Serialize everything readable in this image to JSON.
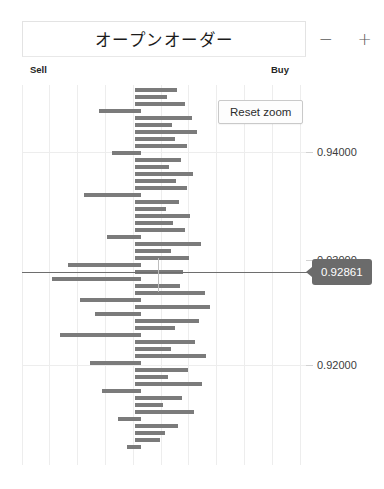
{
  "header": {
    "title": "オープンオーダー",
    "zoom_out_label": "−",
    "zoom_out_icon": "minus-icon",
    "zoom_in_label": "+",
    "zoom_in_icon": "plus-icon"
  },
  "axis_labels": {
    "left": "Sell",
    "right": "Buy"
  },
  "controls": {
    "reset_zoom_label": "Reset zoom"
  },
  "crosshair": {
    "tooltip_value": "0.92861"
  },
  "colors": {
    "bar": "#7b7b7b",
    "grid": "#ededed",
    "tooltip_bg": "#6b6b6b",
    "crosshair": "#6e6e6e",
    "text": "#1b1b1b"
  },
  "chart_data": {
    "type": "bar",
    "orientation": "horizontal",
    "title": "オープンオーダー",
    "xlabel": "",
    "ylabel": "",
    "grid": true,
    "legend_position": "top-inside",
    "legend": [
      "Sell",
      "Buy"
    ],
    "ylim": [
      0.914,
      0.95
    ],
    "yticks": [
      0.94,
      0.93,
      0.92
    ],
    "ytick_labels": [
      "0.94000",
      "0.93000",
      "0.92000"
    ],
    "xlim": [
      -5,
      5
    ],
    "center_price": 0.92861,
    "annotation": "0.92861",
    "note": "Each row is one open order; bar length = order size, direction = Sell (left) / Buy (right). Values below are [price, signed_size] where negative = Sell side.",
    "rows": [
      [
        0.9493,
        1.05
      ],
      [
        0.9485,
        0.6
      ],
      [
        0.94775,
        1.35
      ],
      [
        0.947,
        -1.5
      ],
      [
        0.9462,
        1.6
      ],
      [
        0.94545,
        0.8
      ],
      [
        0.9447,
        1.95
      ],
      [
        0.9439,
        0.95
      ],
      [
        0.94315,
        1.5
      ],
      [
        0.9424,
        -1.1
      ],
      [
        0.9416,
        1.25
      ],
      [
        0.94085,
        0.75
      ],
      [
        0.9401,
        1.8
      ],
      [
        0.9393,
        1.0
      ],
      [
        0.93855,
        1.45
      ],
      [
        0.9378,
        -2.05
      ],
      [
        0.937,
        1.15
      ],
      [
        0.93625,
        0.7
      ],
      [
        0.9355,
        1.7
      ],
      [
        0.9347,
        0.9
      ],
      [
        0.93395,
        1.4
      ],
      [
        0.9332,
        -1.25
      ],
      [
        0.9324,
        2.1
      ],
      [
        0.93165,
        0.85
      ],
      [
        0.9309,
        1.55
      ],
      [
        0.9301,
        -2.4
      ],
      [
        0.92935,
        1.3
      ],
      [
        0.9286,
        -3.6
      ],
      [
        0.92785,
        1.2
      ],
      [
        0.92705,
        2.25
      ],
      [
        0.9263,
        -1.95
      ],
      [
        0.92555,
        2.45
      ],
      [
        0.92475,
        -1.4
      ],
      [
        0.924,
        2.0
      ],
      [
        0.92325,
        1.1
      ],
      [
        0.92245,
        -2.6
      ],
      [
        0.9217,
        1.9
      ],
      [
        0.92095,
        0.95
      ],
      [
        0.92015,
        2.3
      ],
      [
        0.9194,
        -1.55
      ],
      [
        0.91865,
        1.65
      ],
      [
        0.91785,
        0.8
      ],
      [
        0.9171,
        2.15
      ],
      [
        0.91635,
        -1.2
      ],
      [
        0.91555,
        1.45
      ],
      [
        0.9148,
        0.65
      ],
      [
        0.91405,
        1.85
      ]
    ]
  },
  "bars": [
    {
      "t": 3,
      "l": 113,
      "w": 42
    },
    {
      "t": 10,
      "l": 113,
      "w": 32
    },
    {
      "t": 17,
      "l": 113,
      "w": 50
    },
    {
      "t": 24,
      "l": 77,
      "w": 42
    },
    {
      "t": 31,
      "l": 113,
      "w": 57
    },
    {
      "t": 38,
      "l": 113,
      "w": 37
    },
    {
      "t": 45,
      "l": 113,
      "w": 62
    },
    {
      "t": 52,
      "l": 113,
      "w": 40
    },
    {
      "t": 59,
      "l": 113,
      "w": 52
    },
    {
      "t": 66,
      "l": 90,
      "w": 29
    },
    {
      "t": 73,
      "l": 113,
      "w": 46
    },
    {
      "t": 80,
      "l": 113,
      "w": 34
    },
    {
      "t": 87,
      "l": 113,
      "w": 58
    },
    {
      "t": 94,
      "l": 113,
      "w": 41
    },
    {
      "t": 101,
      "l": 113,
      "w": 52
    },
    {
      "t": 108,
      "l": 62,
      "w": 57
    },
    {
      "t": 115,
      "l": 113,
      "w": 44
    },
    {
      "t": 122,
      "l": 113,
      "w": 31
    },
    {
      "t": 129,
      "l": 113,
      "w": 55
    },
    {
      "t": 136,
      "l": 113,
      "w": 38
    },
    {
      "t": 143,
      "l": 113,
      "w": 50
    },
    {
      "t": 150,
      "l": 85,
      "w": 34
    },
    {
      "t": 157,
      "l": 113,
      "w": 66
    },
    {
      "t": 164,
      "l": 113,
      "w": 36
    },
    {
      "t": 171,
      "l": 113,
      "w": 54
    },
    {
      "t": 178,
      "l": 46,
      "w": 73
    },
    {
      "t": 185,
      "l": 113,
      "w": 48
    },
    {
      "t": 192,
      "l": 30,
      "w": 89
    },
    {
      "t": 199,
      "l": 113,
      "w": 45
    },
    {
      "t": 206,
      "l": 113,
      "w": 70
    },
    {
      "t": 213,
      "l": 58,
      "w": 61
    },
    {
      "t": 220,
      "l": 113,
      "w": 75
    },
    {
      "t": 227,
      "l": 73,
      "w": 46
    },
    {
      "t": 234,
      "l": 113,
      "w": 64
    },
    {
      "t": 241,
      "l": 113,
      "w": 40
    },
    {
      "t": 248,
      "l": 38,
      "w": 81
    },
    {
      "t": 255,
      "l": 113,
      "w": 60
    },
    {
      "t": 262,
      "l": 113,
      "w": 36
    },
    {
      "t": 269,
      "l": 113,
      "w": 71
    },
    {
      "t": 276,
      "l": 68,
      "w": 51
    },
    {
      "t": 283,
      "l": 113,
      "w": 53
    },
    {
      "t": 290,
      "l": 113,
      "w": 33
    },
    {
      "t": 297,
      "l": 113,
      "w": 67
    },
    {
      "t": 304,
      "l": 80,
      "w": 39
    },
    {
      "t": 311,
      "l": 113,
      "w": 47
    },
    {
      "t": 318,
      "l": 113,
      "w": 28
    },
    {
      "t": 325,
      "l": 113,
      "w": 59
    },
    {
      "t": 332,
      "l": 96,
      "w": 23
    },
    {
      "t": 339,
      "l": 113,
      "w": 43
    },
    {
      "t": 346,
      "l": 113,
      "w": 30
    },
    {
      "t": 353,
      "l": 113,
      "w": 25
    },
    {
      "t": 360,
      "l": 105,
      "w": 14
    }
  ],
  "vgrid_x": [
    0,
    27,
    55,
    83,
    111,
    139,
    166,
    194,
    222,
    250,
    278
  ],
  "hgrid_y": [
    67,
    187,
    280
  ],
  "yticks": [
    {
      "top": 67,
      "label": "0.94000"
    },
    {
      "top": 175,
      "label": "0.93000"
    },
    {
      "top": 280,
      "label": "0.92000"
    }
  ]
}
